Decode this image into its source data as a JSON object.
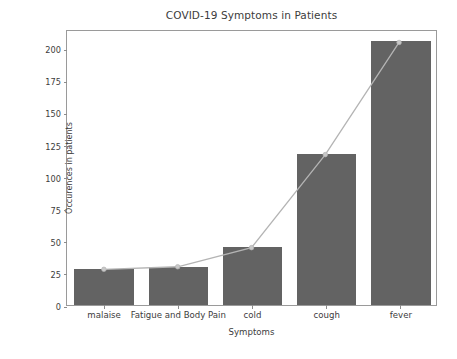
{
  "chart_data": {
    "type": "bar",
    "title": "COVID-19 Symptoms in Patients",
    "xlabel": "Symptoms",
    "ylabel": "Occurences in patients",
    "categories": [
      "malaise",
      "Fatigue and Body Pain",
      "cold",
      "cough",
      "fever"
    ],
    "values": [
      28,
      30,
      45,
      118,
      206
    ],
    "series": [
      {
        "name": "Occurences in patients",
        "type": "bar",
        "values": [
          28,
          30,
          45,
          118,
          206
        ]
      },
      {
        "name": "Trend line",
        "type": "line",
        "values": [
          28,
          30,
          45,
          118,
          206
        ]
      }
    ],
    "ylim": [
      0,
      215
    ],
    "yticks": [
      0,
      25,
      50,
      75,
      100,
      125,
      150,
      175,
      200
    ],
    "ytick_labels": [
      "0",
      "25",
      "50",
      "75",
      "100",
      "125",
      "150",
      "175",
      "200"
    ],
    "grid": false,
    "legend": false,
    "bar_color": "#636363",
    "line_color": "#b4b4b4",
    "marker_color": "#c8c8c8",
    "axis_color": "#9a9a9a",
    "text_color": "#3c3c3c",
    "background": "#ffffff"
  }
}
